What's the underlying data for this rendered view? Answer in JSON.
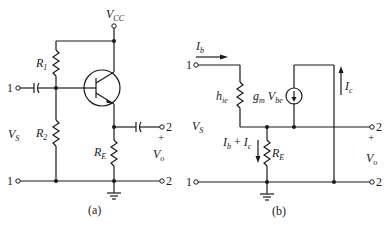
{
  "figure_a": {
    "caption": "(a)",
    "labels": {
      "vcc": "V",
      "vcc_sub": "CC",
      "r1": "R",
      "r1_sub": "1",
      "r2": "R",
      "r2_sub": "2",
      "re": "R",
      "re_sub": "E",
      "vs": "V",
      "vs_sub": "S",
      "vo": "V",
      "vo_sub": "o",
      "plus": "+",
      "term_in_top": "1",
      "term_in_bot": "1",
      "term_out_top": "2",
      "term_out_bot": "2"
    },
    "components": [
      "R1",
      "R2",
      "RE",
      "NPN transistor",
      "input coupling capacitor",
      "output coupling capacitor",
      "ground"
    ]
  },
  "figure_b": {
    "caption": "(b)",
    "labels": {
      "ib": "I",
      "ib_sub": "b",
      "hie": "h",
      "hie_sub": "ie",
      "gm": "g",
      "gm_sub": "m",
      "vbe": "V",
      "vbe_sub": "be",
      "ic": "I",
      "ic_sub": "c",
      "ib_ic_a": "I",
      "ib_ic_a_sub": "b",
      "ib_ic_plus": " + ",
      "ib_ic_b": "I",
      "ib_ic_b_sub": "c",
      "re": "R",
      "re_sub": "E",
      "vs": "V",
      "vs_sub": "S",
      "vo": "V",
      "vo_sub": "o",
      "plus": "+",
      "term_in_top": "1",
      "term_in_bot": "1",
      "term_out_top": "2",
      "term_out_bot": "2"
    },
    "components": [
      "hie",
      "gm Vbe dependent current source",
      "RE",
      "ground"
    ]
  }
}
